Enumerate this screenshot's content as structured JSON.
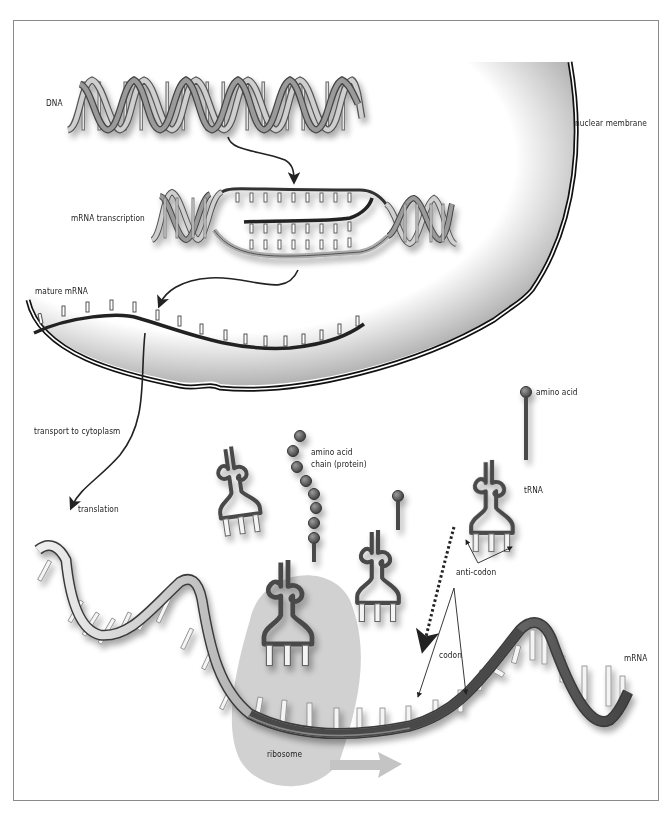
{
  "diagram": {
    "labels": {
      "dna": "DNA",
      "nuclear_membrane": "nuclear membrane",
      "mrna_transcription": "mRNA transcription",
      "mature_mrna": "mature mRNA",
      "transport": "transport to cytoplasm",
      "translation": "translation",
      "amino_acid_chain": "amino acid\nchain (protein)",
      "amino_acid": "amino acid",
      "trna": "tRNA",
      "anti_codon": "anti-codon",
      "codon": "codon",
      "mrna": "mRNA",
      "ribosome": "ribosome"
    },
    "colors": {
      "strand": "#3a3a3a",
      "ribbon_light": "#e6e6e6",
      "ribbon_dark": "#555555",
      "ribosome": "#c9c9c9",
      "amino_acid": "#5a5a5a",
      "frame": "#8a8a8a"
    }
  }
}
